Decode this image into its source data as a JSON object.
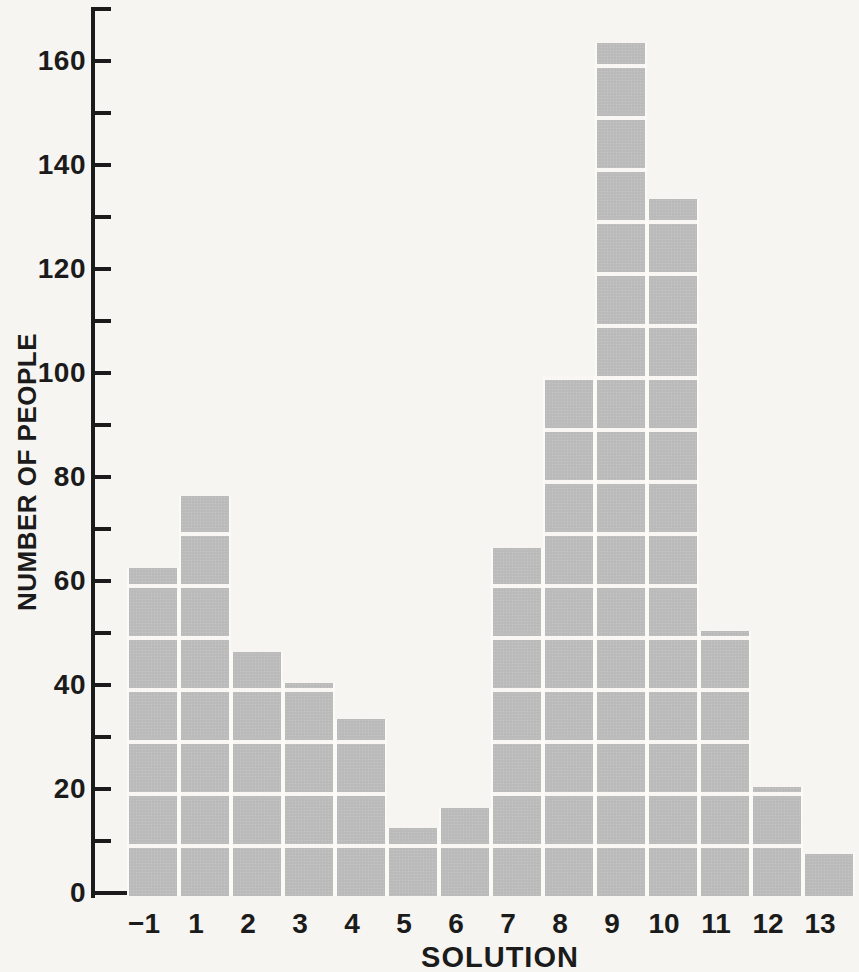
{
  "figure": {
    "background_color": "#f6f5f1",
    "bar_color": "#bcbcbc",
    "grid_line_color": "#f8f7f4",
    "ink_color": "#1b1b1b"
  },
  "chart_data": {
    "type": "bar",
    "title": "",
    "xlabel": "SOLUTION",
    "ylabel": "NUMBER OF PEOPLE",
    "categories": [
      "−1",
      "1",
      "2",
      "3",
      "4",
      "5",
      "6",
      "7",
      "8",
      "9",
      "10",
      "11",
      "12",
      "13"
    ],
    "values": [
      63,
      77,
      47,
      41,
      34,
      13,
      17,
      67,
      100,
      164,
      134,
      51,
      21,
      8
    ],
    "ylim": [
      0,
      170
    ],
    "ytick_interval": 10,
    "ytick_label_interval": 20,
    "ytick_labels": [
      "0",
      "20",
      "40",
      "60",
      "80",
      "100",
      "120",
      "140",
      "160"
    ],
    "legend": [],
    "grid": "white block lines inside bars every 10 units",
    "bar_style": "contiguous histogram blocks separated by white lines"
  }
}
